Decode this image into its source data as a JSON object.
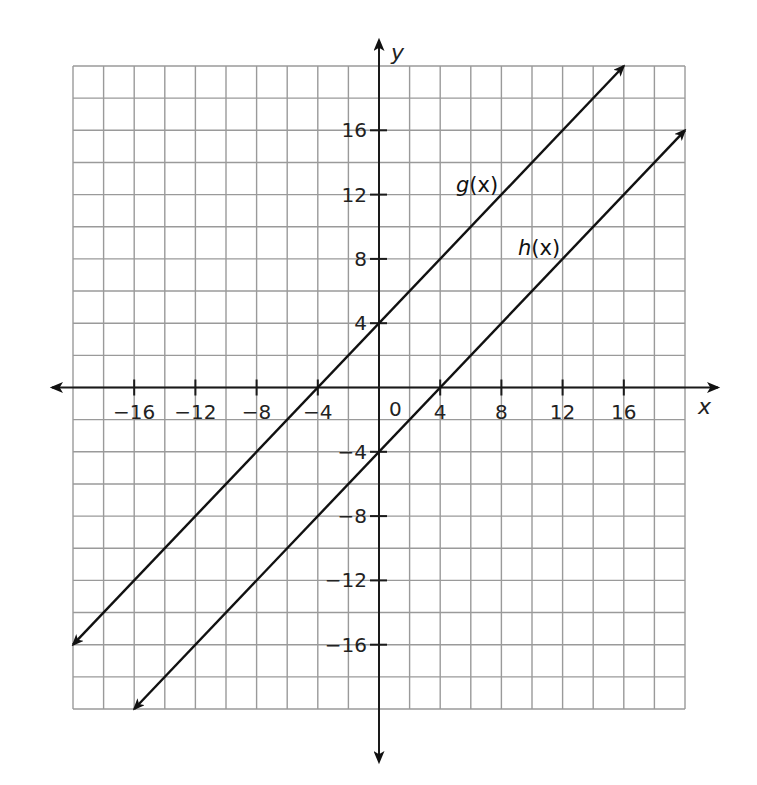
{
  "chart_data": {
    "type": "line",
    "title": "",
    "xlabel": "x",
    "ylabel": "y",
    "xlim": [
      -20,
      20
    ],
    "ylim": [
      -20,
      20
    ],
    "grid": true,
    "grid_step": 2,
    "x_ticks": [
      -16,
      -12,
      -8,
      -4,
      4,
      8,
      12,
      16
    ],
    "x_tick_labels": [
      "−16",
      "−12",
      "−8",
      "−4",
      "4",
      "8",
      "12",
      "16"
    ],
    "y_ticks": [
      16,
      12,
      8,
      4,
      -4,
      -8,
      -12,
      -16
    ],
    "y_tick_labels": [
      "16",
      "12",
      "8",
      "4",
      "−4",
      "−8",
      "−12",
      "−16"
    ],
    "origin_label": "0",
    "series": [
      {
        "name": "g(x)",
        "label_name": "g",
        "label_arg": "(x)",
        "equation": "y = x + 4",
        "slope": 1,
        "intercept": 4,
        "x": [
          -20,
          -4,
          0,
          16
        ],
        "y": [
          -16,
          0,
          4,
          20
        ],
        "arrows": "both"
      },
      {
        "name": "h(x)",
        "label_name": "h",
        "label_arg": "(x)",
        "equation": "y = x - 4",
        "slope": 1,
        "intercept": -4,
        "x": [
          -16,
          0,
          4,
          20
        ],
        "y": [
          -20,
          -4,
          0,
          16
        ],
        "arrows": "both"
      }
    ],
    "legend": "none (inline labels)",
    "colors": {
      "grid": "#9a9a9a",
      "axes": "#1a1a1a",
      "lines": "#111111"
    }
  }
}
